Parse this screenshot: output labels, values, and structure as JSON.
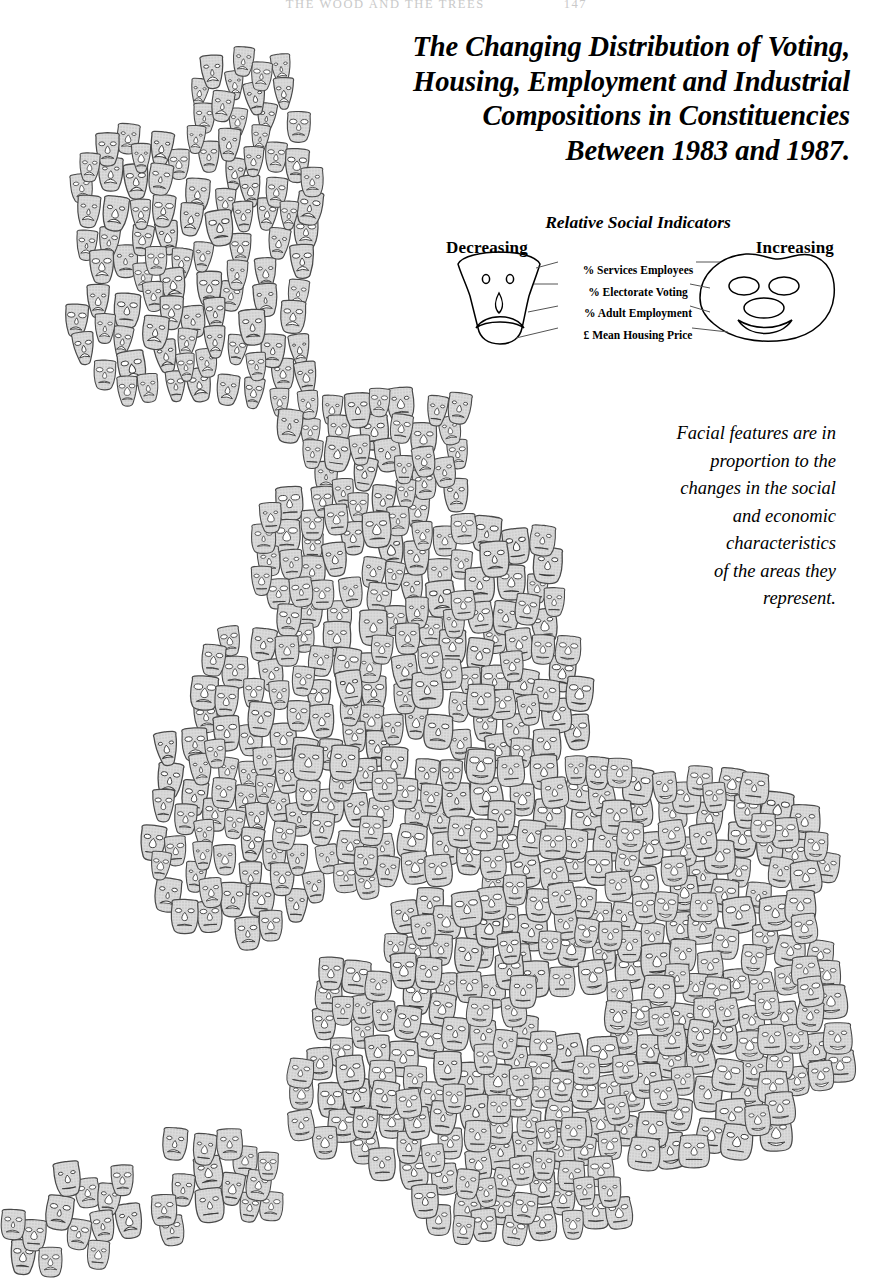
{
  "running_head": {
    "text": "THE WOOD AND THE TREES",
    "folio": "147"
  },
  "title": {
    "lines": [
      "The Changing Distribution of Voting,",
      "Housing, Employment and Industrial",
      "Compositions in Constituencies",
      "Between 1983 and 1987."
    ]
  },
  "legend": {
    "title": "Relative Social Indicators",
    "left_label": "Decreasing",
    "right_label": "Increasing",
    "indicators": [
      "% Services Employees",
      "% Electorate Voting",
      "% Adult Employment",
      "£ Mean Housing Price"
    ],
    "decreasing_face_name": "sad-face-glyph",
    "increasing_face_name": "happy-face-glyph"
  },
  "caption": {
    "lines": [
      "Facial features are in",
      "proportion to the",
      "changes in the social",
      "and economic",
      "characteristics",
      "of the areas they",
      "represent."
    ]
  },
  "colors": {
    "face_fill": "#d4d4d4",
    "face_stroke": "#4a4a4a",
    "ink": "#000000",
    "background": "#ffffff",
    "running_head": "#c9c9c9"
  },
  "chart_data": {
    "type": "cartogram",
    "glyph": "chernoff-face",
    "title": "The Changing Distribution of Voting, Housing, Employment and Industrial Compositions in Constituencies Between 1983 and 1987.",
    "subtitle": "Relative Social Indicators",
    "unit": "parliamentary constituency",
    "region": "Great Britain",
    "period": "1983–1987",
    "n_glyphs": 633,
    "encoding": [
      {
        "feature": "face width",
        "variable": "% Services Employees",
        "low": "Decreasing",
        "high": "Increasing"
      },
      {
        "feature": "eye size",
        "variable": "% Electorate Voting",
        "low": "Decreasing",
        "high": "Increasing"
      },
      {
        "feature": "nose size",
        "variable": "% Adult Employment",
        "low": "Decreasing",
        "high": "Increasing"
      },
      {
        "feature": "mouth curve",
        "variable": "£ Mean Housing Price",
        "low": "Decreasing (frown)",
        "high": "Increasing (smile)"
      }
    ],
    "clusters": [
      {
        "name": "Scotland",
        "x": 195,
        "y": 180,
        "n": 72,
        "mean_mood": -0.72,
        "mean_width": 0.26
      },
      {
        "name": "North England",
        "x": 330,
        "y": 520,
        "n": 96,
        "mean_mood": -0.3,
        "mean_width": 0.42
      },
      {
        "name": "Wales",
        "x": 205,
        "y": 790,
        "n": 58,
        "mean_mood": -0.48,
        "mean_width": 0.34
      },
      {
        "name": "Midlands",
        "x": 420,
        "y": 830,
        "n": 118,
        "mean_mood": 0.05,
        "mean_width": 0.56
      },
      {
        "name": "South West",
        "x": 300,
        "y": 1130,
        "n": 52,
        "mean_mood": -0.1,
        "mean_width": 0.5
      },
      {
        "name": "London / SE",
        "x": 660,
        "y": 960,
        "n": 180,
        "mean_mood": 0.46,
        "mean_width": 0.74
      },
      {
        "name": "East Anglia",
        "x": 760,
        "y": 840,
        "n": 57,
        "mean_mood": 0.34,
        "mean_width": 0.66
      }
    ],
    "grid": false,
    "legend_position": "top-right",
    "axes": "none (geographic cartogram)"
  }
}
